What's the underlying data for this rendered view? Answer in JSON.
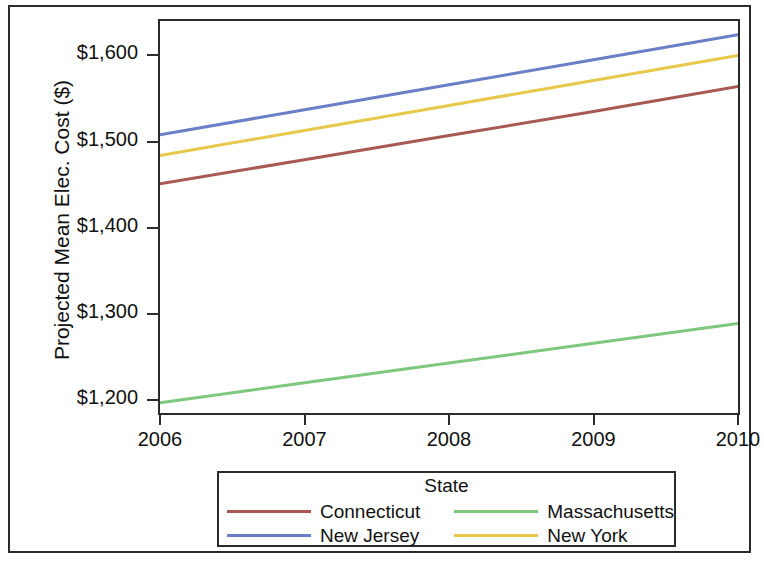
{
  "chart_data": {
    "type": "line",
    "title": "",
    "xlabel": "",
    "ylabel": "Projected Mean Elec. Cost ($)",
    "x": [
      2006,
      2007,
      2008,
      2009,
      2010
    ],
    "xtick_labels": [
      "2006",
      "2007",
      "2008",
      "2009",
      "2010"
    ],
    "ytick_labels": [
      "$1,600",
      "$1,500",
      "$1,400",
      "$1,300",
      "$1,200"
    ],
    "ytick_values": [
      1600,
      1500,
      1400,
      1300,
      1200
    ],
    "xlim": [
      2006,
      2010
    ],
    "ylim": [
      1185,
      1640
    ],
    "grid": false,
    "legend_position": "bottom",
    "legend_title": "State",
    "series": [
      {
        "name": "Connecticut",
        "color": "#A85A52",
        "values": [
          1451,
          1479,
          1507,
          1535,
          1564
        ]
      },
      {
        "name": "Massachusetts",
        "color": "#7DC87D",
        "values": [
          1197,
          1220,
          1243,
          1266,
          1289
        ]
      },
      {
        "name": "New Jersey",
        "color": "#6B7FC7",
        "values": [
          1508,
          1537,
          1566,
          1595,
          1624
        ]
      },
      {
        "name": "New York",
        "color": "#E8C84A",
        "values": [
          1484,
          1513,
          1542,
          1571,
          1600
        ]
      }
    ]
  },
  "axis": {
    "y_title": "Projected Mean Elec. Cost ($)",
    "y_ticks": [
      {
        "label": "$1,600",
        "value": 1600
      },
      {
        "label": "$1,500",
        "value": 1500
      },
      {
        "label": "$1,400",
        "value": 1400
      },
      {
        "label": "$1,300",
        "value": 1300
      },
      {
        "label": "$1,200",
        "value": 1200
      }
    ],
    "x_ticks": [
      {
        "label": "2006",
        "value": 2006
      },
      {
        "label": "2007",
        "value": 2007
      },
      {
        "label": "2008",
        "value": 2008
      },
      {
        "label": "2009",
        "value": 2009
      },
      {
        "label": "2010",
        "value": 2010
      }
    ]
  },
  "legend": {
    "title": "State",
    "entries": [
      {
        "label": "Connecticut",
        "color": "#A85A52"
      },
      {
        "label": "Massachusetts",
        "color": "#7DC87D"
      },
      {
        "label": "New Jersey",
        "color": "#6B7FC7"
      },
      {
        "label": "New York",
        "color": "#E8C84A"
      }
    ]
  }
}
